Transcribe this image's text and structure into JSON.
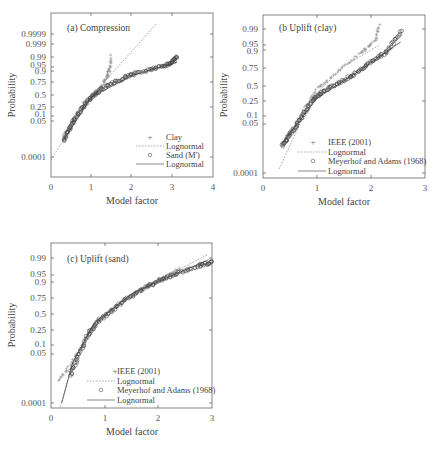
{
  "chart_data": [
    {
      "type": "scatter",
      "panel": "a",
      "title": "(a) Compression",
      "xlabel": "Model factor",
      "ylabel": "Probability",
      "xlim": [
        0,
        4
      ],
      "x_ticks": [
        0,
        1,
        2,
        3,
        4
      ],
      "y_scale": "normal probability",
      "y_ticks": [
        "0.0001",
        "0.05",
        "0.1",
        "0.25",
        "0.5",
        "0.75",
        "0.9",
        "0.95",
        "0.99",
        "0.999",
        "0.9999"
      ],
      "legend": [
        "Clay",
        "Lognormal",
        "Sand (M')",
        "Lognormal"
      ],
      "legend_position": "lower right",
      "series": [
        {
          "name": "Clay",
          "marker": "+",
          "x": [
            0.35,
            0.5,
            0.7,
            0.9,
            1.05,
            1.2,
            1.3,
            1.38,
            1.42,
            1.45,
            1.48
          ],
          "y": [
            0.01,
            0.04,
            0.15,
            0.35,
            0.5,
            0.65,
            0.75,
            0.85,
            0.9,
            0.95,
            0.99
          ]
        },
        {
          "name": "Lognormal (Clay)",
          "style": "dashed",
          "x": [
            0.0,
            1.0,
            1.5,
            2.6
          ],
          "y": [
            5e-05,
            0.5,
            0.9,
            0.99999
          ]
        },
        {
          "name": "Sand (M')",
          "marker": "o",
          "x": [
            0.3,
            0.45,
            0.6,
            0.8,
            1.0,
            1.2,
            1.5,
            1.8,
            2.1,
            2.5,
            2.8,
            3.0,
            3.1
          ],
          "y": [
            0.003,
            0.02,
            0.08,
            0.25,
            0.45,
            0.6,
            0.75,
            0.85,
            0.9,
            0.94,
            0.96,
            0.975,
            0.99
          ]
        },
        {
          "name": "Lognormal (Sand)",
          "style": "solid",
          "x": [
            0.3,
            1.0,
            2.0,
            3.1
          ],
          "y": [
            0.003,
            0.45,
            0.88,
            0.975
          ]
        }
      ]
    },
    {
      "type": "scatter",
      "panel": "b",
      "title": "(b Uplift (clay)",
      "xlabel": "Model factor",
      "ylabel": "Probability",
      "xlim": [
        0,
        3
      ],
      "x_ticks": [
        0,
        1,
        2,
        3
      ],
      "y_scale": "normal probability",
      "y_ticks": [
        "0.0001",
        "0.05",
        "0.1",
        "0.25",
        "0.5",
        "0.75",
        "0.9",
        "0.95",
        "0.99"
      ],
      "legend": [
        "IEEE (2001)",
        "Lognormal",
        "Meyerhof and Adams (1968)",
        "Lognormal"
      ],
      "legend_position": "lower right",
      "series": [
        {
          "name": "IEEE (2001)",
          "marker": "+",
          "x": [
            0.4,
            0.6,
            0.8,
            1.0,
            1.2,
            1.5,
            1.8,
            1.95,
            2.1,
            2.15
          ],
          "y": [
            0.01,
            0.05,
            0.2,
            0.45,
            0.6,
            0.8,
            0.92,
            0.95,
            0.98,
            0.995
          ]
        },
        {
          "name": "Lognormal (IEEE)",
          "style": "dashed",
          "x": [
            0.3,
            0.9,
            1.5,
            2.15
          ],
          "y": [
            0.0002,
            0.3,
            0.8,
            0.96
          ]
        },
        {
          "name": "Meyerhof and Adams (1968)",
          "marker": "o",
          "x": [
            0.35,
            0.5,
            0.7,
            0.9,
            1.1,
            1.4,
            1.7,
            2.0,
            2.3,
            2.55
          ],
          "y": [
            0.005,
            0.02,
            0.08,
            0.25,
            0.4,
            0.55,
            0.7,
            0.85,
            0.93,
            0.99
          ]
        },
        {
          "name": "Lognormal (Meyerhof)",
          "style": "solid",
          "x": [
            0.35,
            1.0,
            1.8,
            2.55
          ],
          "y": [
            0.007,
            0.3,
            0.75,
            0.97
          ]
        }
      ]
    },
    {
      "type": "scatter",
      "panel": "c",
      "title": "(c) Uplift (sand)",
      "xlabel": "Model factor",
      "ylabel": "Probability",
      "xlim": [
        0,
        3
      ],
      "x_ticks": [
        0,
        1,
        2,
        3
      ],
      "y_scale": "normal probability",
      "y_ticks": [
        "0.0001",
        "0.05",
        "0.1",
        "0.25",
        "0.5",
        "0.75",
        "0.9",
        "0.95",
        "0.99"
      ],
      "legend": [
        "IEEE (2001)",
        "Lognormal",
        "Meyerhof and Adams (1968)",
        "Lognormal"
      ],
      "legend_position": "lower right",
      "series": [
        {
          "name": "IEEE (2001)",
          "marker": "+",
          "x": [
            0.15,
            0.3,
            0.5,
            0.7,
            0.9,
            1.2,
            1.5,
            1.8,
            2.1,
            2.4
          ],
          "y": [
            0.003,
            0.01,
            0.05,
            0.2,
            0.4,
            0.6,
            0.78,
            0.88,
            0.94,
            0.97
          ]
        },
        {
          "name": "Lognormal (IEEE)",
          "style": "dashed",
          "x": [
            0.17,
            0.4,
            0.8,
            1.5,
            2.2,
            3.0
          ],
          "y": [
            5e-05,
            0.02,
            0.35,
            0.8,
            0.95,
            0.995
          ]
        },
        {
          "name": "Meyerhof and Adams (1968)",
          "marker": "o",
          "x": [
            0.35,
            0.5,
            0.7,
            0.9,
            1.2,
            1.5,
            1.8,
            2.1,
            2.4,
            2.8,
            3.0
          ],
          "y": [
            0.005,
            0.04,
            0.2,
            0.4,
            0.6,
            0.78,
            0.88,
            0.93,
            0.96,
            0.98,
            0.985
          ]
        },
        {
          "name": "Lognormal (Meyerhof)",
          "style": "solid",
          "x": [
            0.2,
            0.4,
            0.8,
            1.5,
            2.2,
            3.0
          ],
          "y": [
            0.0001,
            0.02,
            0.35,
            0.8,
            0.94,
            0.99
          ]
        }
      ]
    }
  ],
  "panels": {
    "a": {
      "title": "(a) Compression",
      "xlabel": "Model factor",
      "ylabel": "Probability",
      "x_tick_labels": [
        "0",
        "1",
        "2",
        "3",
        "4"
      ],
      "y_tick_labels": [
        "0.9999",
        "0.999",
        "0.99",
        "0.95",
        "0.9",
        "0.75",
        "0.5",
        "0.25",
        "0.1",
        "0.05",
        "0.0001"
      ],
      "legend": [
        "Clay",
        "Lognormal",
        "Sand (M')",
        "Lognormal"
      ]
    },
    "b": {
      "title": "(b Uplift (clay)",
      "xlabel": "Model factor",
      "ylabel": "Probability",
      "x_tick_labels": [
        "0",
        "1",
        "2",
        "3"
      ],
      "y_tick_labels": [
        "0.99",
        "0.95",
        "0.9",
        "0.75",
        "0.5",
        "0.25",
        "0.1",
        "0.05",
        "0.0001"
      ],
      "legend": [
        "IEEE (2001)",
        "Lognormal",
        "Meyerhof and Adams (1968)",
        "Lognormal"
      ]
    },
    "c": {
      "title": "(c) Uplift (sand)",
      "xlabel": "Model factor",
      "ylabel": "Probability",
      "x_tick_labels": [
        "0",
        "1",
        "2",
        "3"
      ],
      "y_tick_labels": [
        "0.99",
        "0.95",
        "0.9",
        "0.75",
        "0.5",
        "0.25",
        "0.1",
        "0.05",
        "0.0001"
      ],
      "legend": [
        "IEEE (2001)",
        "Lognormal",
        "Meyerhof and Adams (1968)",
        "Lognormal"
      ]
    }
  }
}
